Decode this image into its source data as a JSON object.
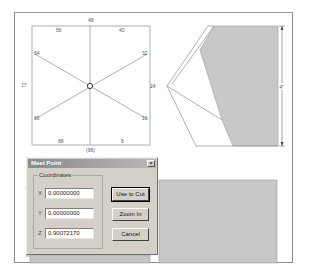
{
  "compass_view": {
    "labels": {
      "top": "48",
      "top_left": "56",
      "top_right": "40",
      "upper_left": "64",
      "upper_right": "32",
      "left": "72",
      "right": "24",
      "lower_left": "80",
      "lower_right": "16",
      "bottom_left": "88",
      "bottom_right": "8",
      "bottom": "(96)"
    }
  },
  "profile_view": {
    "dimension_label": "4\"",
    "fill_color": "#c8c8c8"
  },
  "bottom_view": {
    "fill_color": "#c8c8c8"
  },
  "dialog": {
    "title": "Meet Point",
    "close_glyph": "×",
    "group_label": "Coordinates",
    "fields": [
      {
        "axis": "X",
        "value": "0.00000000"
      },
      {
        "axis": "Y",
        "value": "0.00000000"
      },
      {
        "axis": "Z",
        "value": "0.90072170"
      }
    ],
    "buttons": {
      "use_to_cut": "Use to Cut",
      "zoom_in": "Zoom In",
      "cancel": "Cancel"
    }
  }
}
